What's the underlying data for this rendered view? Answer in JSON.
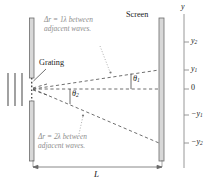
{
  "diagram": {
    "title_labels": {
      "screen": "Screen",
      "grating": "Grating",
      "length": "L"
    },
    "annotations": [
      {
        "id": "upper",
        "line1": "Δr = 1λ between",
        "line2": "adjacent waves."
      },
      {
        "id": "lower",
        "line1": "Δr = 2λ between",
        "line2": "adjacent waves."
      }
    ],
    "angles": [
      {
        "id": "theta1",
        "base": "θ",
        "sub": "1"
      },
      {
        "id": "theta2",
        "base": "θ",
        "sub": "2"
      }
    ],
    "axis": {
      "name": "y",
      "ticks": [
        {
          "id": "y2",
          "base": "y",
          "sub": "2",
          "sign": ""
        },
        {
          "id": "y1",
          "base": "y",
          "sub": "1",
          "sign": ""
        },
        {
          "id": "zero",
          "base": "0",
          "sub": "",
          "sign": ""
        },
        {
          "id": "ny1",
          "base": "y",
          "sub": "1",
          "sign": "−"
        },
        {
          "id": "ny2",
          "base": "y",
          "sub": "2",
          "sign": "−"
        }
      ]
    },
    "colors": {
      "bar_fill": "#d8d8d8",
      "bar_edge": "#6b6b6b",
      "dashed_ray": "#4a4a4a",
      "annotation_text": "#8d8d8d",
      "axis_line": "#8d8d8d",
      "plain_text": "#1a1a1a"
    }
  }
}
